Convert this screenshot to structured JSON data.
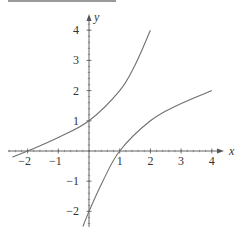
{
  "chart_data": {
    "type": "line",
    "title": "",
    "xlabel": "x",
    "ylabel": "y",
    "xlim": [
      -2.6,
      4.4
    ],
    "ylim": [
      -2.5,
      4.5
    ],
    "grid": false,
    "x_ticks": [
      -2,
      -1,
      1,
      2,
      3,
      4
    ],
    "x_tick_labels": [
      "−2",
      "−1",
      "1",
      "2",
      "3",
      "4"
    ],
    "y_ticks": [
      4,
      3,
      2,
      1,
      -1,
      -2
    ],
    "y_tick_labels": [
      "4",
      "3",
      "2",
      "1",
      "−1",
      "−2"
    ],
    "series": [
      {
        "name": "f(x)",
        "x": [
          -2.5,
          -2,
          -1,
          0,
          1,
          1.5,
          2
        ],
        "y": [
          -0.2,
          0,
          0.45,
          1,
          2.0,
          2.85,
          4.0
        ],
        "color": "#707070"
      },
      {
        "name": "f inverse(x)",
        "x": [
          -0.2,
          0,
          0.45,
          1,
          2.0,
          2.85,
          4.0
        ],
        "y": [
          -2.5,
          -2,
          -1,
          0,
          1,
          1.5,
          2
        ],
        "color": "#707070"
      }
    ]
  },
  "axes": {
    "x_label": "x",
    "y_label": "y",
    "color": "#555555"
  },
  "decor": {
    "top_bar_color": "#9a9a9a"
  }
}
